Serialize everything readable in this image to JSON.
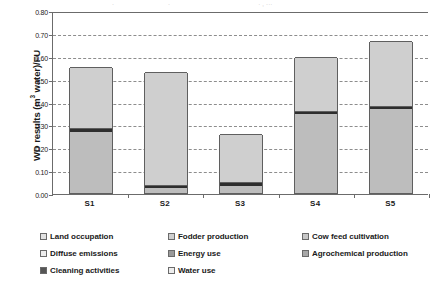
{
  "figure": {
    "top_cut_caption_fragments": [
      "·",
      "·",
      "· ,  ···"
    ]
  },
  "chart_data": {
    "type": "bar",
    "stacked": true,
    "title": "",
    "xlabel": "",
    "ylabel": "WD results (m3 water)/FU",
    "ylabel_parts": {
      "pre": "WD results (m",
      "sup": "3",
      "post": " water)/FU"
    },
    "categories": [
      "S1",
      "S2",
      "S3",
      "S4",
      "S5"
    ],
    "ylim": [
      0.0,
      0.8
    ],
    "ytick_step": 0.1,
    "ytick_labels": [
      "0.00",
      "0.10",
      "0.20",
      "0.30",
      "0.40",
      "0.50",
      "0.60",
      "0.70",
      "0.80"
    ],
    "ytick_values": [
      0.0,
      0.1,
      0.2,
      0.3,
      0.4,
      0.5,
      0.6,
      0.7,
      0.8
    ],
    "grid": "horizontal-dashed",
    "legend_position": "below-plot",
    "series": [
      {
        "name": "Cow feed cultivation",
        "color": "#bdbdbd",
        "values": [
          0.268,
          0.024,
          0.03,
          0.346,
          0.366
        ]
      },
      {
        "name": "Cleaning activities",
        "color": "#2e2e2e",
        "values": [
          0.016,
          0.011,
          0.019,
          0.012,
          0.016
        ]
      },
      {
        "name": "Fodder production",
        "color": "#cfcfcf",
        "values": [
          0.266,
          0.492,
          0.208,
          0.238,
          0.283
        ]
      }
    ],
    "totals": [
      0.55,
      0.527,
      0.257,
      0.596,
      0.665
    ],
    "bar_detail": [
      {
        "category": "S1",
        "total": 0.55,
        "segments": [
          {
            "label": "Cow feed cultivation",
            "from": 0.0,
            "to": 0.268,
            "color": "#bdbdbd"
          },
          {
            "label": "Cleaning activities",
            "from": 0.268,
            "to": 0.284,
            "color": "#2e2e2e"
          },
          {
            "label": "Fodder production",
            "from": 0.284,
            "to": 0.55,
            "color": "#cfcfcf"
          }
        ]
      },
      {
        "category": "S2",
        "total": 0.527,
        "segments": [
          {
            "label": "Cow feed cultivation",
            "from": 0.0,
            "to": 0.024,
            "color": "#bdbdbd"
          },
          {
            "label": "Cleaning activities",
            "from": 0.024,
            "to": 0.035,
            "color": "#2e2e2e"
          },
          {
            "label": "Fodder production",
            "from": 0.035,
            "to": 0.527,
            "color": "#cfcfcf"
          }
        ]
      },
      {
        "category": "S3",
        "total": 0.257,
        "segments": [
          {
            "label": "Cow feed cultivation",
            "from": 0.0,
            "to": 0.03,
            "color": "#bdbdbd"
          },
          {
            "label": "Cleaning activities",
            "from": 0.03,
            "to": 0.049,
            "color": "#2e2e2e"
          },
          {
            "label": "Fodder production",
            "from": 0.049,
            "to": 0.257,
            "color": "#cfcfcf"
          }
        ]
      },
      {
        "category": "S4",
        "total": 0.596,
        "segments": [
          {
            "label": "Cow feed cultivation",
            "from": 0.0,
            "to": 0.346,
            "color": "#bdbdbd"
          },
          {
            "label": "Cleaning activities",
            "from": 0.346,
            "to": 0.358,
            "color": "#2e2e2e"
          },
          {
            "label": "Fodder production",
            "from": 0.358,
            "to": 0.596,
            "color": "#cfcfcf"
          }
        ]
      },
      {
        "category": "S5",
        "total": 0.665,
        "segments": [
          {
            "label": "Cow feed cultivation",
            "from": 0.0,
            "to": 0.366,
            "color": "#bdbdbd"
          },
          {
            "label": "Cleaning activities",
            "from": 0.366,
            "to": 0.382,
            "color": "#2e2e2e"
          },
          {
            "label": "Fodder production",
            "from": 0.382,
            "to": 0.665,
            "color": "#cfcfcf"
          }
        ]
      }
    ],
    "legend": [
      {
        "label": "Land occupation",
        "color": "#e2e2e2",
        "col": 0,
        "row": 0
      },
      {
        "label": "Fodder production",
        "color": "#cfcfcf",
        "col": 1,
        "row": 0
      },
      {
        "label": "Cow feed cultivation",
        "color": "#c7c7c7",
        "col": 2,
        "row": 0
      },
      {
        "label": "Diffuse emissions",
        "color": "#ededed",
        "col": 0,
        "row": 1
      },
      {
        "label": "Energy use",
        "color": "#9a9a9a",
        "col": 1,
        "row": 1
      },
      {
        "label": "Agrochemical production",
        "color": "#a8a8a8",
        "col": 2,
        "row": 1
      },
      {
        "label": "Cleaning activities",
        "color": "#555555",
        "col": 0,
        "row": 2
      },
      {
        "label": "Water use",
        "color": "#ededed",
        "col": 1,
        "row": 2
      }
    ]
  }
}
